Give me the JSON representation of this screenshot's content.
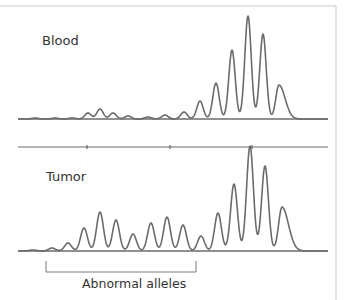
{
  "chart_data": {
    "type": "line",
    "title": "",
    "xlabel": "",
    "ylabel": "",
    "grid": false,
    "panels": [
      {
        "name": "Blood",
        "description": "Capillary electrophoresis trace, mostly flat with a cluster of tall peaks on the right",
        "baseline_y": 119,
        "x_range": [
          18,
          328
        ],
        "peaks": [
          {
            "x": 35,
            "height": 1
          },
          {
            "x": 55,
            "height": 1
          },
          {
            "x": 72,
            "height": 1
          },
          {
            "x": 88,
            "height": 6
          },
          {
            "x": 100,
            "height": 10
          },
          {
            "x": 113,
            "height": 6
          },
          {
            "x": 128,
            "height": 3
          },
          {
            "x": 148,
            "height": 2
          },
          {
            "x": 165,
            "height": 4
          },
          {
            "x": 184,
            "height": 7
          },
          {
            "x": 200,
            "height": 18
          },
          {
            "x": 216,
            "height": 36
          },
          {
            "x": 232,
            "height": 69
          },
          {
            "x": 248,
            "height": 103
          },
          {
            "x": 263,
            "height": 85
          },
          {
            "x": 279,
            "height": 34
          }
        ]
      },
      {
        "name": "Tumor",
        "description": "Capillary electrophoresis trace with many additional peaks (abnormal alleles) plus the same tall cluster",
        "baseline_y": 251,
        "x_range": [
          18,
          328
        ],
        "peaks": [
          {
            "x": 33,
            "height": 1
          },
          {
            "x": 52,
            "height": 3
          },
          {
            "x": 68,
            "height": 8
          },
          {
            "x": 84,
            "height": 23
          },
          {
            "x": 100,
            "height": 39
          },
          {
            "x": 116,
            "height": 31
          },
          {
            "x": 133,
            "height": 17
          },
          {
            "x": 151,
            "height": 28
          },
          {
            "x": 167,
            "height": 34
          },
          {
            "x": 183,
            "height": 26
          },
          {
            "x": 201,
            "height": 15
          },
          {
            "x": 218,
            "height": 38
          },
          {
            "x": 234,
            "height": 67
          },
          {
            "x": 250,
            "height": 105
          },
          {
            "x": 265,
            "height": 85
          },
          {
            "x": 282,
            "height": 44
          }
        ]
      }
    ],
    "annotations": [
      {
        "text": "Blood",
        "panel": "Blood"
      },
      {
        "text": "Tumor",
        "panel": "Tumor"
      },
      {
        "text": "Abnormal alleles",
        "type": "bracket",
        "x_range": [
          46,
          196
        ]
      }
    ]
  },
  "labels": {
    "blood": "Blood",
    "tumor": "Tumor",
    "bracket_caption": "Abnormal alleles"
  },
  "colors": {
    "trace": "#6b6b6b",
    "axis": "#6b6b6b",
    "frame": "#c8c8c8",
    "text": "#333333"
  }
}
